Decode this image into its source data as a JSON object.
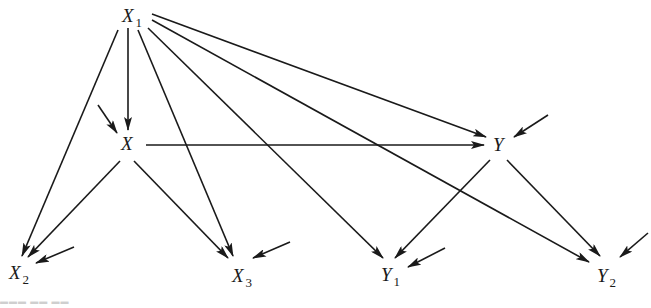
{
  "diagram": {
    "type": "path-diagram",
    "colors": {
      "ink": "#1a1a1a",
      "background": "#ffffff"
    },
    "nodes": [
      {
        "id": "X1",
        "label": "X",
        "sub": "1",
        "x": 122,
        "y": 22
      },
      {
        "id": "X",
        "label": "X",
        "sub": "",
        "x": 121,
        "y": 150
      },
      {
        "id": "Y",
        "label": "Y",
        "sub": "",
        "x": 493,
        "y": 151
      },
      {
        "id": "X2",
        "label": "X",
        "sub": "2",
        "x": 9,
        "y": 279
      },
      {
        "id": "X3",
        "label": "X",
        "sub": "3",
        "x": 232,
        "y": 282
      },
      {
        "id": "Y1",
        "label": "Y",
        "sub": "1",
        "x": 381,
        "y": 281
      },
      {
        "id": "Y2",
        "label": "Y",
        "sub": "2",
        "x": 597,
        "y": 282
      }
    ],
    "edges": [
      {
        "from": "X1",
        "to": "X",
        "x1": 128,
        "y1": 28,
        "x2": 128,
        "y2": 130
      },
      {
        "from": "X1",
        "to": "X2",
        "x1": 118,
        "y1": 30,
        "x2": 22,
        "y2": 256
      },
      {
        "from": "X1",
        "to": "X3",
        "x1": 138,
        "y1": 30,
        "x2": 233,
        "y2": 256
      },
      {
        "from": "X1",
        "to": "Y1",
        "x1": 148,
        "y1": 28,
        "x2": 383,
        "y2": 258
      },
      {
        "from": "X1",
        "to": "Y2",
        "x1": 152,
        "y1": 20,
        "x2": 589,
        "y2": 262
      },
      {
        "from": "X1",
        "to": "Y",
        "x1": 152,
        "y1": 14,
        "x2": 486,
        "y2": 137
      },
      {
        "from": "X",
        "to": "Y",
        "x1": 146,
        "y1": 145,
        "x2": 484,
        "y2": 145
      },
      {
        "from": "X",
        "to": "X2",
        "x1": 120,
        "y1": 161,
        "x2": 28,
        "y2": 257
      },
      {
        "from": "X",
        "to": "X3",
        "x1": 134,
        "y1": 161,
        "x2": 228,
        "y2": 258
      },
      {
        "from": "Y",
        "to": "Y1",
        "x1": 490,
        "y1": 160,
        "x2": 395,
        "y2": 258
      },
      {
        "from": "Y",
        "to": "Y2",
        "x1": 507,
        "y1": 160,
        "x2": 600,
        "y2": 256
      }
    ],
    "error_terms": [
      {
        "target": "X",
        "x1": 98,
        "y1": 105,
        "x2": 117,
        "y2": 133
      },
      {
        "target": "Y",
        "x1": 548,
        "y1": 115,
        "x2": 514,
        "y2": 137
      },
      {
        "target": "X2",
        "x1": 74,
        "y1": 247,
        "x2": 36,
        "y2": 263
      },
      {
        "target": "X3",
        "x1": 290,
        "y1": 242,
        "x2": 253,
        "y2": 258
      },
      {
        "target": "Y1",
        "x1": 445,
        "y1": 248,
        "x2": 408,
        "y2": 267
      },
      {
        "target": "Y2",
        "x1": 648,
        "y1": 233,
        "x2": 620,
        "y2": 257
      }
    ]
  }
}
